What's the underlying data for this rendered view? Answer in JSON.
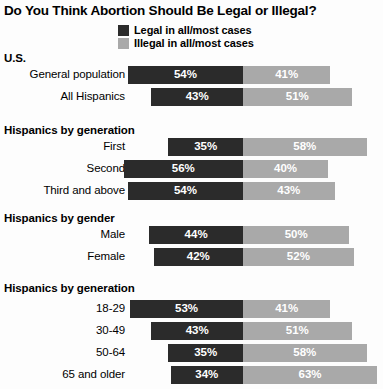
{
  "title": "Do You Think Abortion Should Be Legal or Illegal?",
  "legend": {
    "items": [
      {
        "label": "Legal in all/most cases",
        "color": "#2b2b2b",
        "key": "legal"
      },
      {
        "label": "Illegal in all/most cases",
        "color": "#a9a9a9",
        "key": "illegal"
      }
    ]
  },
  "colors": {
    "legal": "#2b2b2b",
    "illegal": "#a9a9a9",
    "background": "#fdfdfd",
    "text": "#000000",
    "value_text": "#ffffff"
  },
  "sections": [
    {
      "heading": "U.S.",
      "rows": [
        {
          "label": "General population",
          "legal": "54%",
          "illegal": "41%"
        },
        {
          "label": "All Hispanics",
          "legal": "43%",
          "illegal": "51%"
        }
      ]
    },
    {
      "heading": "Hispanics by generation",
      "rows": [
        {
          "label": "First",
          "legal": "35%",
          "illegal": "58%"
        },
        {
          "label": "Second",
          "legal": "56%",
          "illegal": "40%"
        },
        {
          "label": "Third and above",
          "legal": "54%",
          "illegal": "43%"
        }
      ]
    },
    {
      "heading": "Hispanics by gender",
      "rows": [
        {
          "label": "Male",
          "legal": "44%",
          "illegal": "50%"
        },
        {
          "label": "Female",
          "legal": "42%",
          "illegal": "52%"
        }
      ]
    },
    {
      "heading": "Hispanics by generation",
      "rows": [
        {
          "label": "18-29",
          "legal": "53%",
          "illegal": "41%"
        },
        {
          "label": "30-49",
          "legal": "43%",
          "illegal": "51%"
        },
        {
          "label": "50-64",
          "legal": "35%",
          "illegal": "58%"
        },
        {
          "label": "65 and older",
          "legal": "34%",
          "illegal": "63%"
        }
      ]
    }
  ],
  "chart_data": {
    "type": "bar",
    "title": "Do You Think Abortion Should Be Legal or Illegal?",
    "xlabel": "",
    "ylabel": "",
    "orientation": "horizontal",
    "stacked": true,
    "diverging": true,
    "grid": false,
    "legend_position": "top-center",
    "units": "percent",
    "categories": [
      "General population",
      "All Hispanics",
      "First",
      "Second",
      "Third and above",
      "Male",
      "Female",
      "18-29",
      "30-49",
      "50-64",
      "65 and older"
    ],
    "groups": [
      {
        "name": "U.S.",
        "categories": [
          "General population",
          "All Hispanics"
        ]
      },
      {
        "name": "Hispanics by generation",
        "categories": [
          "First",
          "Second",
          "Third and above"
        ]
      },
      {
        "name": "Hispanics by gender",
        "categories": [
          "Male",
          "Female"
        ]
      },
      {
        "name": "Hispanics by generation",
        "categories": [
          "18-29",
          "30-49",
          "50-64",
          "65 and older"
        ]
      }
    ],
    "series": [
      {
        "name": "Legal in all/most cases",
        "color": "#2b2b2b",
        "values": [
          54,
          43,
          35,
          56,
          54,
          44,
          42,
          53,
          43,
          35,
          34
        ]
      },
      {
        "name": "Illegal in all/most cases",
        "color": "#a9a9a9",
        "values": [
          41,
          51,
          58,
          40,
          43,
          50,
          52,
          41,
          51,
          58,
          63
        ]
      }
    ]
  },
  "layout": {
    "divider_x": 243,
    "px_per_percent": 2.13,
    "bar_height": 18,
    "row_pitch": 22
  }
}
